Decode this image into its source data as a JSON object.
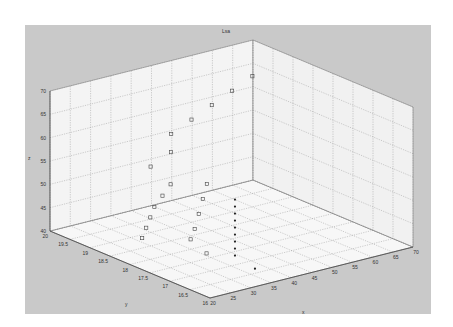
{
  "chart_data": {
    "type": "scatter3d",
    "title": "Lsa",
    "xlabel": "x",
    "ylabel": "y",
    "zlabel": "z",
    "x_ticks": [
      20,
      25,
      30,
      35,
      40,
      45,
      50,
      55,
      60,
      65,
      70
    ],
    "y_ticks": [
      20,
      19.5,
      19,
      18.5,
      18,
      17.5,
      17,
      16.5,
      16
    ],
    "z_ticks": [
      40,
      45,
      50,
      55,
      60,
      65,
      70
    ],
    "xlim": [
      20,
      70
    ],
    "ylim": [
      16,
      20
    ],
    "zlim": [
      40,
      70
    ],
    "grid": true,
    "series": [
      {
        "name": "open squares",
        "marker": "square-open",
        "points": [
          {
            "x": 60,
            "y": 19.0,
            "z": 68
          },
          {
            "x": 55,
            "y": 19.0,
            "z": 66
          },
          {
            "x": 50,
            "y": 19.0,
            "z": 64
          },
          {
            "x": 45,
            "y": 19.0,
            "z": 62
          },
          {
            "x": 40,
            "y": 19.0,
            "z": 60
          },
          {
            "x": 35,
            "y": 18.5,
            "z": 59
          },
          {
            "x": 30,
            "y": 18.5,
            "z": 57
          },
          {
            "x": 30,
            "y": 18.0,
            "z": 55
          },
          {
            "x": 28,
            "y": 18.0,
            "z": 53
          },
          {
            "x": 26,
            "y": 18.0,
            "z": 51
          },
          {
            "x": 25,
            "y": 18.0,
            "z": 49
          },
          {
            "x": 24,
            "y": 18.0,
            "z": 47
          },
          {
            "x": 23,
            "y": 18.0,
            "z": 45
          },
          {
            "x": 34,
            "y": 17.5,
            "z": 56
          },
          {
            "x": 33,
            "y": 17.5,
            "z": 53
          },
          {
            "x": 32,
            "y": 17.5,
            "z": 50
          },
          {
            "x": 31,
            "y": 17.5,
            "z": 47
          },
          {
            "x": 30,
            "y": 17.5,
            "z": 45
          },
          {
            "x": 29,
            "y": 17.0,
            "z": 44
          }
        ]
      },
      {
        "name": "filled dots",
        "marker": "dot-filled",
        "points": [
          {
            "x": 36,
            "y": 17.0,
            "z": 54
          },
          {
            "x": 36,
            "y": 17.0,
            "z": 52.5
          },
          {
            "x": 36,
            "y": 17.0,
            "z": 51
          },
          {
            "x": 36,
            "y": 17.0,
            "z": 49.5
          },
          {
            "x": 36,
            "y": 17.0,
            "z": 48
          },
          {
            "x": 36,
            "y": 17.0,
            "z": 46.5
          },
          {
            "x": 36,
            "y": 17.0,
            "z": 45
          },
          {
            "x": 36,
            "y": 17.0,
            "z": 43.5
          },
          {
            "x": 36,
            "y": 17.0,
            "z": 42
          },
          {
            "x": 36,
            "y": 16.5,
            "z": 41
          }
        ]
      }
    ]
  },
  "labels": {
    "title": "Lsa",
    "x": "x",
    "y": "y",
    "z": "z"
  }
}
